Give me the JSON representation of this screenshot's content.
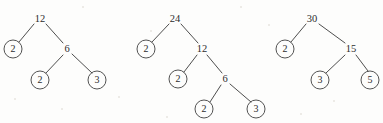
{
  "figure": {
    "background_color": "#fdfdfc",
    "stroke_color": "#3a3a3a",
    "text_color": "#2c2c2c"
  },
  "trees": [
    {
      "name": "factor-tree-12",
      "root_value": "12",
      "nodes": [
        {
          "id": "t1-root",
          "label": "12",
          "shape": "plain",
          "x": 40,
          "y": 19
        },
        {
          "id": "t1-l",
          "label": "2",
          "shape": "circle",
          "x": 13,
          "y": 49,
          "r": 9
        },
        {
          "id": "t1-r",
          "label": "6",
          "shape": "plain",
          "x": 67,
          "y": 49
        },
        {
          "id": "t1-rl",
          "label": "2",
          "shape": "circle",
          "x": 40,
          "y": 80,
          "r": 9
        },
        {
          "id": "t1-rr",
          "label": "3",
          "shape": "circle",
          "x": 97,
          "y": 80,
          "r": 9
        }
      ],
      "edges": [
        {
          "from": "t1-root",
          "to": "t1-l",
          "x1": 34,
          "y1": 24,
          "x2": 19,
          "y2": 42
        },
        {
          "from": "t1-root",
          "to": "t1-r",
          "x1": 46,
          "y1": 24,
          "x2": 63,
          "y2": 43
        },
        {
          "from": "t1-r",
          "to": "t1-rl",
          "x1": 63,
          "y1": 55,
          "x2": 46,
          "y2": 73
        },
        {
          "from": "t1-r",
          "to": "t1-rr",
          "x1": 72,
          "y1": 54,
          "x2": 92,
          "y2": 73
        }
      ]
    },
    {
      "name": "factor-tree-24",
      "root_value": "24",
      "nodes": [
        {
          "id": "t2-root",
          "label": "24",
          "shape": "plain",
          "x": 175,
          "y": 19
        },
        {
          "id": "t2-l",
          "label": "2",
          "shape": "circle",
          "x": 146,
          "y": 49,
          "r": 9
        },
        {
          "id": "t2-r",
          "label": "12",
          "shape": "plain",
          "x": 202,
          "y": 49
        },
        {
          "id": "t2-rl",
          "label": "2",
          "shape": "circle",
          "x": 178,
          "y": 79,
          "r": 9
        },
        {
          "id": "t2-rr",
          "label": "6",
          "shape": "plain",
          "x": 225,
          "y": 79
        },
        {
          "id": "t2-rrl",
          "label": "2",
          "shape": "circle",
          "x": 204,
          "y": 109,
          "r": 9
        },
        {
          "id": "t2-rrr",
          "label": "3",
          "shape": "circle",
          "x": 256,
          "y": 109,
          "r": 9
        }
      ],
      "edges": [
        {
          "from": "t2-root",
          "to": "t2-l",
          "x1": 169,
          "y1": 24,
          "x2": 152,
          "y2": 42
        },
        {
          "from": "t2-root",
          "to": "t2-r",
          "x1": 181,
          "y1": 24,
          "x2": 198,
          "y2": 43
        },
        {
          "from": "t2-r",
          "to": "t2-rl",
          "x1": 197,
          "y1": 55,
          "x2": 184,
          "y2": 72
        },
        {
          "from": "t2-r",
          "to": "t2-rr",
          "x1": 207,
          "y1": 55,
          "x2": 222,
          "y2": 73
        },
        {
          "from": "t2-rr",
          "to": "t2-rrl",
          "x1": 221,
          "y1": 85,
          "x2": 210,
          "y2": 102
        },
        {
          "from": "t2-rr",
          "to": "t2-rrr",
          "x1": 230,
          "y1": 84,
          "x2": 251,
          "y2": 102
        }
      ]
    },
    {
      "name": "factor-tree-30",
      "root_value": "30",
      "nodes": [
        {
          "id": "t3-root",
          "label": "30",
          "shape": "plain",
          "x": 312,
          "y": 19
        },
        {
          "id": "t3-l",
          "label": "2",
          "shape": "circle",
          "x": 285,
          "y": 49,
          "r": 9
        },
        {
          "id": "t3-r",
          "label": "15",
          "shape": "plain",
          "x": 351,
          "y": 49
        },
        {
          "id": "t3-rl",
          "label": "3",
          "shape": "circle",
          "x": 320,
          "y": 80,
          "r": 9
        },
        {
          "id": "t3-rr",
          "label": "5",
          "shape": "circle",
          "x": 370,
          "y": 80,
          "r": 9
        }
      ],
      "edges": [
        {
          "from": "t3-root",
          "to": "t3-l",
          "x1": 306,
          "y1": 24,
          "x2": 291,
          "y2": 42
        },
        {
          "from": "t3-root",
          "to": "t3-r",
          "x1": 319,
          "y1": 24,
          "x2": 345,
          "y2": 43
        },
        {
          "from": "t3-r",
          "to": "t3-rl",
          "x1": 345,
          "y1": 55,
          "x2": 326,
          "y2": 73
        },
        {
          "from": "t3-r",
          "to": "t3-rr",
          "x1": 356,
          "y1": 55,
          "x2": 368,
          "y2": 71
        }
      ]
    }
  ],
  "specks": [
    {
      "x": 61,
      "y": 108,
      "size": 2
    },
    {
      "x": 118,
      "y": 96,
      "size": 2
    },
    {
      "x": 150,
      "y": 30,
      "size": 2
    },
    {
      "x": 268,
      "y": 24,
      "size": 2
    },
    {
      "x": 300,
      "y": 113,
      "size": 2
    },
    {
      "x": 166,
      "y": 116,
      "size": 2
    },
    {
      "x": 82,
      "y": 6,
      "size": 2
    },
    {
      "x": 240,
      "y": 6,
      "size": 2
    },
    {
      "x": 333,
      "y": 100,
      "size": 2
    },
    {
      "x": 14,
      "y": 98,
      "size": 2
    }
  ]
}
